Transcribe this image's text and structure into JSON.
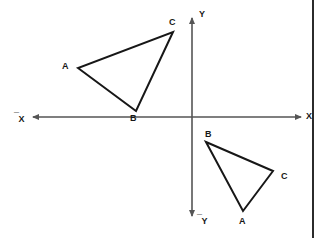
{
  "figure": {
    "background_color": "#ffffff",
    "stroke_color": "#171717",
    "axis_color": "#555555",
    "width": 321,
    "height": 238
  },
  "axes": {
    "origin": {
      "x": 192,
      "y": 117
    },
    "x_axis": {
      "label_positive": "X",
      "label_negative": "X",
      "negative_prefix": "¯",
      "left_end": {
        "x": 33,
        "y": 117
      },
      "right_end": {
        "x": 301,
        "y": 117
      },
      "label_positive_pos": {
        "x": 306,
        "y": 112
      },
      "label_negative_pos": {
        "x": 14,
        "y": 112
      }
    },
    "y_axis": {
      "label_positive": "Y",
      "label_negative": "Y",
      "negative_prefix": "¯",
      "top_end": {
        "x": 192,
        "y": 18
      },
      "bottom_end": {
        "x": 192,
        "y": 216
      },
      "label_positive_pos": {
        "x": 199,
        "y": 10
      },
      "label_negative_pos": {
        "x": 197,
        "y": 214
      }
    }
  },
  "shapes": [
    {
      "name": "triangle-preimage",
      "quadrant": "second",
      "vertices": [
        {
          "label": "A",
          "x": 78,
          "y": 68,
          "label_x": 62,
          "label_y": 62
        },
        {
          "label": "B",
          "x": 136,
          "y": 111,
          "label_x": 130,
          "label_y": 114
        },
        {
          "label": "C",
          "x": 173,
          "y": 32,
          "label_x": 169,
          "label_y": 18
        }
      ]
    },
    {
      "name": "triangle-image",
      "quadrant": "fourth",
      "vertices": [
        {
          "label": "B",
          "x": 206,
          "y": 142,
          "label_x": 205,
          "label_y": 130
        },
        {
          "label": "C",
          "x": 273,
          "y": 171,
          "label_x": 281,
          "label_y": 172
        },
        {
          "label": "A",
          "x": 243,
          "y": 211,
          "label_x": 239,
          "label_y": 217
        }
      ]
    }
  ],
  "page_edge": {
    "name": "page-edge-rule",
    "x": 312
  }
}
